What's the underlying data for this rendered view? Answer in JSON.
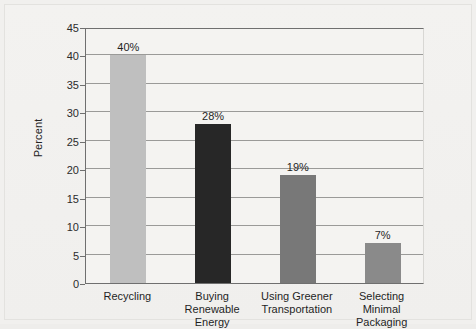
{
  "figure": {
    "background_color": "#f1f0ee",
    "plot_background_color": "#f4f3f1",
    "axis_color": "#6f6f6f",
    "gridline_color": "#9a9a98"
  },
  "chart_data": {
    "type": "bar",
    "title": "",
    "xlabel": "",
    "ylabel": "Percent",
    "categories": [
      "Recycling",
      "Buying Renewable\nEnergy",
      "Using Greener\nTransportation",
      "Selecting Minimal\nPackaging"
    ],
    "values": [
      40,
      28,
      19,
      7
    ],
    "data_labels": [
      "40%",
      "28%",
      "19%",
      "7%"
    ],
    "bar_colors": [
      "#bfbfbf",
      "#272727",
      "#787878",
      "#8a8a8a"
    ],
    "ylim": [
      0,
      45
    ],
    "ytick_labels": [
      "0",
      "5",
      "10",
      "15",
      "20",
      "25",
      "30",
      "35",
      "40",
      "45"
    ],
    "ytick_values": [
      0,
      5,
      10,
      15,
      20,
      25,
      30,
      35,
      40,
      45
    ],
    "grid": "horizontal",
    "legend": "none"
  }
}
